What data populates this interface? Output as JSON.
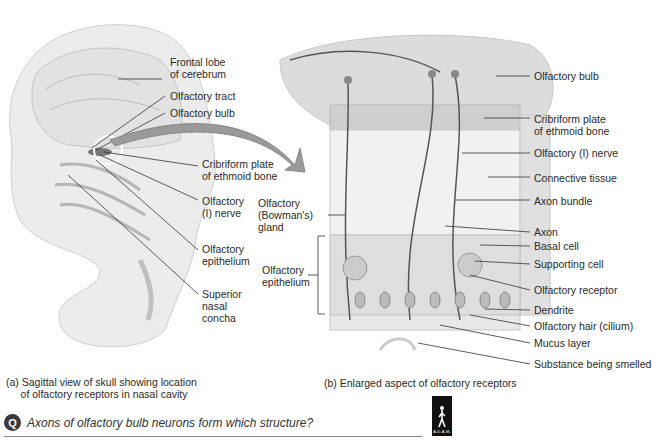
{
  "panel_a": {
    "labels": {
      "frontal_lobe": "Frontal lobe\nof cerebrum",
      "olfactory_tract": "Olfactory tract",
      "olfactory_bulb": "Olfactory bulb",
      "cribriform": "Cribriform plate\nof ethmoid bone",
      "olfactory_nerve": "Olfactory\n(I) nerve",
      "olfactory_epithelium": "Olfactory\nepithelium",
      "superior_concha": "Superior\nnasal\nconcha"
    },
    "caption": "(a) Sagittal view of skull showing location\n     of olfactory receptors in nasal cavity"
  },
  "panel_b": {
    "labels": {
      "olfactory_bulb": "Olfactory bulb",
      "cribriform": "Cribriform plate\nof ethmoid bone",
      "olfactory_nerve": "Olfactory (I) nerve",
      "connective_tissue": "Connective tissue",
      "axon_bundle": "Axon bundle",
      "bowmans_gland": "Olfactory\n(Bowman's)\ngland",
      "axon": "Axon",
      "basal_cell": "Basal cell",
      "supporting_cell": "Supporting cell",
      "olfactory_epithelium": "Olfactory\nepithelium",
      "olfactory_receptor": "Olfactory receptor",
      "dendrite": "Dendrite",
      "olfactory_hair": "Olfactory hair (cilium)",
      "mucus_layer": "Mucus layer",
      "substance": "Substance being smelled"
    },
    "caption": "(b) Enlarged aspect of olfactory receptors"
  },
  "question": {
    "badge": "Q",
    "text": "Axons of olfactory bulb neurons form which structure?"
  },
  "logo": {
    "text": "A.D.A.M."
  },
  "colors": {
    "label_line": "#333333",
    "tissue": "#d8d8d8",
    "arrow": "#9a9a9a"
  }
}
